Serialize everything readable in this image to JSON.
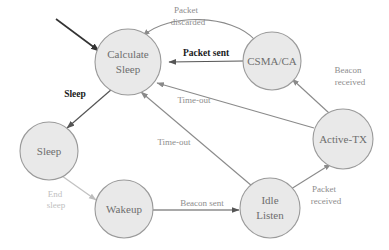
{
  "diagram": {
    "type": "state-machine",
    "colors": {
      "node_fill": "#e9e9e9",
      "node_stroke": "#9a9a9a",
      "node_text": "#6e6e6e",
      "edge_dark": "#555555",
      "edge_mid": "#8a8a8a",
      "edge_light": "#c2c2c2",
      "label_strong": "#1a1a1a",
      "label_gray": "#8d8d8d",
      "label_faint": "#c0c0c0",
      "background": "#ffffff"
    },
    "nodes": [
      {
        "id": "calculate-sleep",
        "label_line1": "Calculate",
        "label_line2": "Sleep",
        "cx": 128,
        "cy": 62,
        "r": 33
      },
      {
        "id": "csma-ca",
        "label_line1": "CSMA/CA",
        "label_line2": "",
        "cx": 272,
        "cy": 61,
        "r": 29
      },
      {
        "id": "active-tx",
        "label_line1": "Active-TX",
        "label_line2": "",
        "cx": 343,
        "cy": 139,
        "r": 30
      },
      {
        "id": "sleep",
        "label_line1": "Sleep",
        "label_line2": "",
        "cx": 49,
        "cy": 151,
        "r": 29
      },
      {
        "id": "wakeup",
        "label_line1": "Wakeup",
        "label_line2": "",
        "cx": 124,
        "cy": 209,
        "r": 29
      },
      {
        "id": "idle-listen",
        "label_line1": "Idle",
        "label_line2": "Listen",
        "cx": 270,
        "cy": 208,
        "r": 30
      }
    ],
    "edges": [
      {
        "id": "start-entry",
        "label": "",
        "from": "start",
        "to": "calculate-sleep"
      },
      {
        "id": "csma-to-calculate-discarded",
        "label_line1": "Packet",
        "label_line2": "discarded",
        "from": "csma-ca",
        "to": "calculate-sleep",
        "style": "curved"
      },
      {
        "id": "csma-to-calculate-sent",
        "label_line1": "Packet sent",
        "label_line2": "",
        "from": "csma-ca",
        "to": "calculate-sleep",
        "style": "straight"
      },
      {
        "id": "active-to-csma",
        "label_line1": "Beacon",
        "label_line2": "received",
        "from": "active-tx",
        "to": "csma-ca"
      },
      {
        "id": "active-to-calculate-timeout",
        "label_line1": "Time-out",
        "label_line2": "",
        "from": "active-tx",
        "to": "calculate-sleep"
      },
      {
        "id": "idle-to-calculate-timeout",
        "label_line1": "Time-out",
        "label_line2": "",
        "from": "idle-listen",
        "to": "calculate-sleep"
      },
      {
        "id": "calculate-to-sleep",
        "label_line1": "Sleep",
        "label_line2": "",
        "from": "calculate-sleep",
        "to": "sleep"
      },
      {
        "id": "sleep-to-wakeup",
        "label_line1": "End",
        "label_line2": "sleep",
        "from": "sleep",
        "to": "wakeup"
      },
      {
        "id": "wakeup-to-idle",
        "label_line1": "Beacon sent",
        "label_line2": "",
        "from": "wakeup",
        "to": "idle-listen"
      },
      {
        "id": "idle-to-active",
        "label_line1": "Packet",
        "label_line2": "received",
        "from": "idle-listen",
        "to": "active-tx"
      }
    ],
    "labels": {
      "packet_discarded_1": "Packet",
      "packet_discarded_2": "discarded",
      "packet_sent": "Packet sent",
      "beacon_received_1": "Beacon",
      "beacon_received_2": "received",
      "sleep": "Sleep",
      "time_out_upper": "Time-out",
      "time_out_lower": "Time-out",
      "end_sleep_1": "End",
      "end_sleep_2": "sleep",
      "beacon_sent": "Beacon sent",
      "packet_received_1": "Packet",
      "packet_received_2": "received"
    },
    "node_text": {
      "calculate_1": "Calculate",
      "calculate_2": "Sleep",
      "csma": "CSMA/CA",
      "active_tx": "Active-TX",
      "sleep": "Sleep",
      "wakeup": "Wakeup",
      "idle_1": "Idle",
      "idle_2": "Listen"
    }
  }
}
